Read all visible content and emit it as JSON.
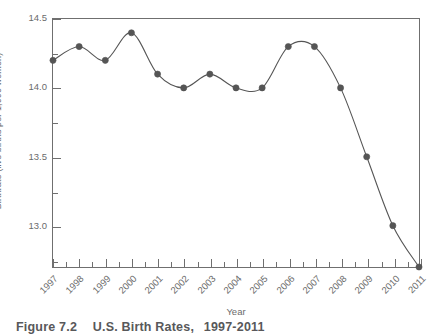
{
  "chart_data": {
    "type": "line",
    "title": "",
    "xlabel": "Year",
    "ylabel": "Birthrate (live births per 1,000 women)",
    "categories": [
      "1997",
      "1998",
      "1999",
      "2000",
      "2001",
      "2002",
      "2003",
      "2004",
      "2005",
      "2006",
      "2007",
      "2008",
      "2009",
      "2010",
      "2011"
    ],
    "values": [
      14.2,
      14.3,
      14.2,
      14.4,
      14.1,
      14.0,
      14.1,
      14.0,
      14.0,
      14.3,
      14.3,
      14.0,
      13.5,
      13.0,
      12.7
    ],
    "series": [
      {
        "name": "U.S. Birthrate",
        "values": [
          14.2,
          14.3,
          14.2,
          14.4,
          14.1,
          14.0,
          14.1,
          14.0,
          14.0,
          14.3,
          14.3,
          14.0,
          13.5,
          13.0,
          12.7
        ]
      }
    ],
    "ylim": [
      12.7,
      14.5
    ],
    "xlim": [
      "1997",
      "2011"
    ],
    "y_tick_labels": [
      "14.5",
      "14.0",
      "13.5",
      "13.0"
    ],
    "y_tick_values": [
      14.5,
      14.0,
      13.5,
      13.0
    ],
    "y_minor_tick_values": [
      14.25,
      13.75,
      13.25,
      12.75
    ],
    "grid": false,
    "legend": "none",
    "interpolation": "smooth",
    "marker": "circle",
    "line_color": "#555555",
    "marker_color": "#555555",
    "axis_color": "#6f6f6f",
    "text_color": "#6b6b6b",
    "background_color": "#ffffff"
  },
  "caption": {
    "number": "Figure 7.2",
    "label": "U.S. Birth Rates,",
    "range": "1997-2011"
  }
}
